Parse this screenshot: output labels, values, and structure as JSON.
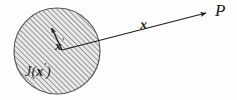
{
  "figure": {
    "canvas": {
      "width": 237,
      "height": 100
    },
    "background_color": "#fdfdfd",
    "ink_color": "#1c1c1c"
  },
  "source_region": {
    "shape": "circle",
    "center_x": 57,
    "center_y": 51,
    "radius": 43,
    "fill_pattern": "diagonal-hatch",
    "hatch_angle_deg": 45,
    "hatch_spacing_px": 2.6,
    "hatch_color": "#6e6e6e",
    "fill_color": "#e6e6e6",
    "outline_color": "#555555",
    "outline_width": 1.2,
    "label": {
      "text_j": "J",
      "open_paren": "(",
      "arg": "x",
      "prime": "′",
      "close_paren": ")",
      "full_text": "J(x′)"
    }
  },
  "vectors": [
    {
      "name": "source-position-vector",
      "label": "x",
      "prime": "′",
      "full_label": "x′",
      "origin_x": 62,
      "origin_y": 50,
      "tip_x": 51,
      "tip_y": 26,
      "arrowhead": "filled-triangle",
      "stroke_width": 1.3
    },
    {
      "name": "field-position-vector",
      "label": "x",
      "prime": "",
      "full_label": "x",
      "origin_x": 62,
      "origin_y": 50,
      "tip_x": 209,
      "tip_y": 12,
      "arrowhead": "filled-triangle",
      "stroke_width": 1.2
    }
  ],
  "field_point": {
    "label": "P",
    "x": 215,
    "y": 11
  }
}
